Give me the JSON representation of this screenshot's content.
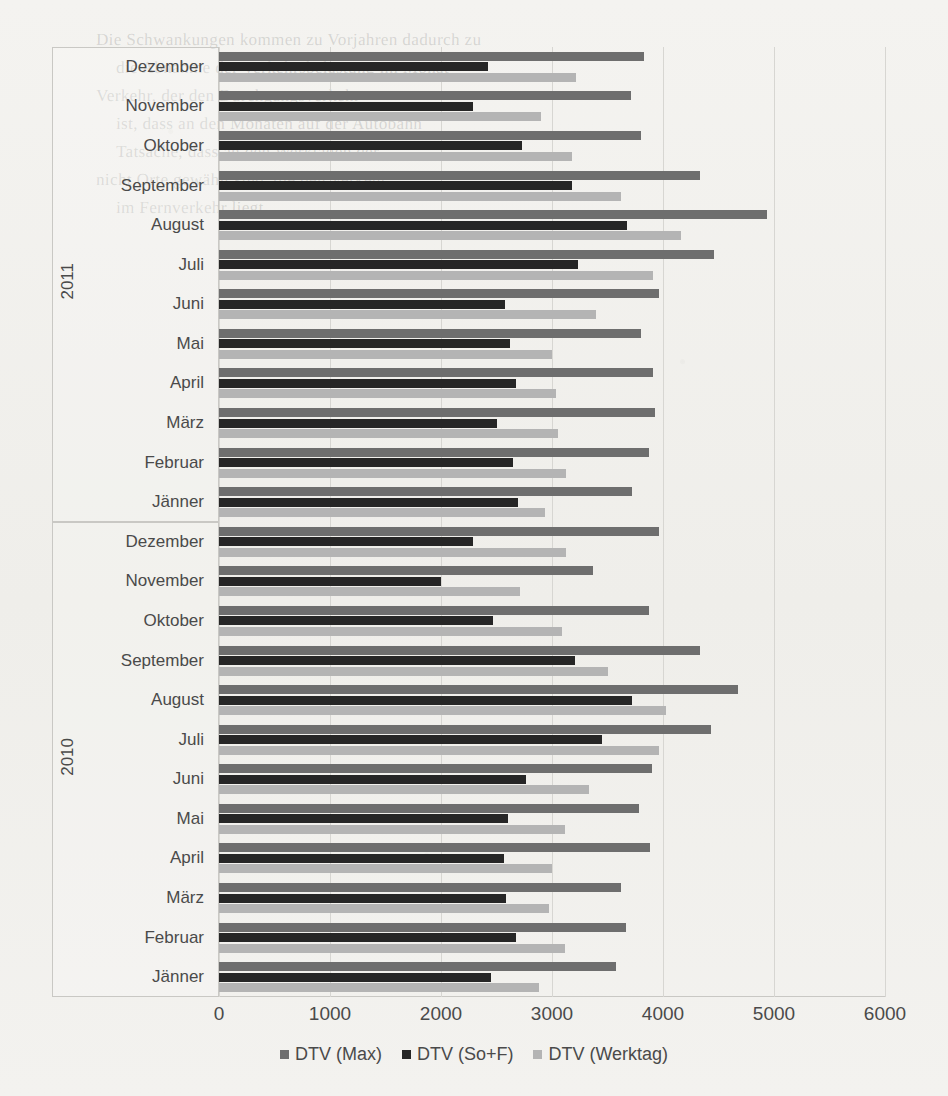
{
  "chart_data": {
    "type": "bar",
    "orientation": "horizontal",
    "title": "",
    "xlabel": "",
    "ylabel": "",
    "xlim": [
      0,
      6000
    ],
    "xticks": [
      0,
      1000,
      2000,
      3000,
      4000,
      5000,
      6000
    ],
    "grid": true,
    "legend_position": "bottom",
    "legend": [
      "DTV (Max)",
      "DTV (So+F)",
      "DTV (Werktag)"
    ],
    "series": [
      {
        "name": "DTV (Max)",
        "color": "#6e6e6e",
        "values": [
          3830,
          3710,
          3800,
          4330,
          4940,
          4460,
          3960,
          3800,
          3910,
          3930,
          3870,
          3720,
          3960,
          3370,
          3870,
          4330,
          4680,
          4430,
          3900,
          3780,
          3880,
          3620,
          3670,
          3580
        ]
      },
      {
        "name": "DTV (So+F)",
        "color": "#262626",
        "values": [
          2420,
          2290,
          2730,
          3180,
          3680,
          3230,
          2580,
          2620,
          2680,
          2500,
          2650,
          2690,
          2290,
          2000,
          2470,
          3210,
          3720,
          3450,
          2770,
          2600,
          2570,
          2590,
          2680,
          2450
        ]
      },
      {
        "name": "DTV (Werktag)",
        "color": "#b4b4b4",
        "values": [
          3220,
          2900,
          3180,
          3620,
          4160,
          3910,
          3400,
          3000,
          3040,
          3050,
          3130,
          2940,
          3130,
          2710,
          3090,
          3500,
          4030,
          3960,
          3330,
          3120,
          3000,
          2970,
          3120,
          2880
        ]
      }
    ],
    "groups": [
      {
        "year": "2011",
        "categories": [
          "Dezember",
          "November",
          "Oktober",
          "September",
          "August",
          "Juli",
          "Juni",
          "Mai",
          "April",
          "März",
          "Februar",
          "Jänner"
        ]
      },
      {
        "year": "2010",
        "categories": [
          "Dezember",
          "November",
          "Oktober",
          "September",
          "August",
          "Juli",
          "Juni",
          "Mai",
          "April",
          "März",
          "Februar",
          "Jänner"
        ]
      }
    ]
  },
  "ghost_text": [
    {
      "x": 96,
      "y": 30,
      "text": "Die Schwankungen kommen zu Vorjahren dadurch zu"
    },
    {
      "x": 116,
      "y": 58,
      "text": "die Abnahme der Verkehrsbelastung im Monat"
    },
    {
      "x": 96,
      "y": 86,
      "text": "Verkehr, der den Durchgangsverkehr"
    },
    {
      "x": 116,
      "y": 114,
      "text": "ist, dass an den Monaten auf der Autobahn"
    },
    {
      "x": 116,
      "y": 142,
      "text": "Tatsache, dass an den Werktagen der"
    },
    {
      "x": 96,
      "y": 170,
      "text": "nicht Orte gewählt sind, die den Verkehr"
    },
    {
      "x": 116,
      "y": 198,
      "text": "im Fernverkehr liegt."
    }
  ]
}
